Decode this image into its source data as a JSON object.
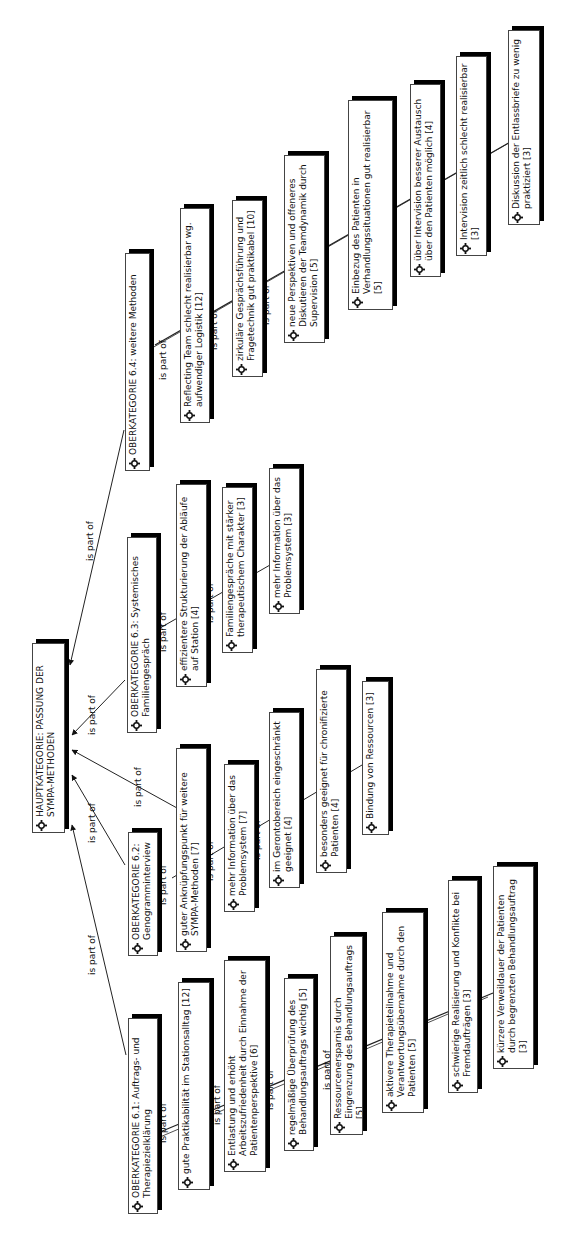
{
  "diagram": {
    "edge_label": "is part of",
    "colors": {
      "background": "#ffffff",
      "box_border": "#444444",
      "box_shadow": "#000000",
      "text": "#111111",
      "edge": "#222222"
    },
    "icon": "gear-icon",
    "root": {
      "id": "main",
      "label": "HAUPTKATEGORIE: PASSUNG DER SYMPA-METHODEN"
    },
    "categories": [
      {
        "id": "c61",
        "label": "OBERKATEGORIE 6.1: Auftrags- und Therapiezielklärung",
        "children": [
          {
            "id": "c61a",
            "label": "gute Praktikabilität im Stationsalltag [12]"
          },
          {
            "id": "c61b",
            "label": "Entlastung und erhöht Arbeitszufriedenheit durch Einnahme der Patientenperspektive [6]"
          },
          {
            "id": "c61c",
            "label": "regelmäßige Überprüfung des Behandlungsauftrags wichtig [5]"
          },
          {
            "id": "c61d",
            "label": "Ressourcenersparnis durch Eingrenzung des Behandlungsauftrags [5]"
          },
          {
            "id": "c61e",
            "label": "aktivere Therapieteilnahme und Verantwortungsübernahme durch den Patienten [5]"
          },
          {
            "id": "c61f",
            "label": "schwierige Realisierung und Konflikte bei Fremdaufträgen [3]"
          },
          {
            "id": "c61g",
            "label": "kürzere Verweildauer der Patienten durch begrenzten Behandlungsauftrag [3]"
          }
        ]
      },
      {
        "id": "c62",
        "label": "OBERKATEGORIE 6.2: Genogramminterview",
        "children": [
          {
            "id": "c62a",
            "label": "guter Anknüpfungspunkt für weitere SYMPA-Methoden [7]"
          },
          {
            "id": "c62b",
            "label": "mehr Information über das Problemsystem [7]"
          },
          {
            "id": "c62c",
            "label": "im Gerontobereich eingeschränkt geeignet [4]"
          },
          {
            "id": "c62d",
            "label": "besonders geeignet für chronifizierte Patienten [4]"
          },
          {
            "id": "c62e",
            "label": "Bindung von Ressourcen [3]"
          }
        ]
      },
      {
        "id": "c63",
        "label": "OBERKATEGORIE 6.3: Systemisches Familiengespräch",
        "children": [
          {
            "id": "c63a",
            "label": "effizientere Strukturierung der Abläufe auf Station [4]"
          },
          {
            "id": "c63b",
            "label": "Familiengespräche mit stärker therapeutischem Charakter [3]"
          },
          {
            "id": "c63c",
            "label": "mehr Information über das Problemsystem [3]"
          }
        ]
      },
      {
        "id": "c64",
        "label": "OBERKATEGORIE 6.4: weitere Methoden",
        "children": [
          {
            "id": "c64a",
            "label": "Reflecting Team schlecht realisierbar wg. aufwendiger Logistik [12]"
          },
          {
            "id": "c64b",
            "label": "zirkuläre Gesprächsführung und Fragetechnik gut praktikabel [10]"
          },
          {
            "id": "c64c",
            "label": "neue Perspektiven und offeneres Diskutieren der Teamdynamik durch Supervision [5]"
          },
          {
            "id": "c64d",
            "label": "Einbezug des Patienten in Verhandlungssituationen gut realisierbar [5]"
          },
          {
            "id": "c64e",
            "label": "über Intervision besserer Austausch über den Patienten möglich [4]"
          },
          {
            "id": "c64f",
            "label": "Intervision zeitlich schlecht realisierbar [3]"
          },
          {
            "id": "c64g",
            "label": "Diskussion der Entlassbriefe zu wenig praktiziert [3]"
          }
        ]
      }
    ]
  }
}
